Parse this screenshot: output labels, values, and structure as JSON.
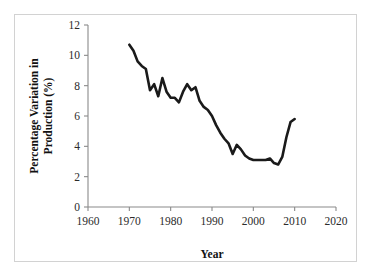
{
  "figure": {
    "background_color": "#ffffff",
    "frame_color": "#d2d2d2",
    "axis_color": "#8a8a8a",
    "line_color": "#1a1a1a"
  },
  "chart_data": {
    "type": "line",
    "title": "",
    "xlabel": "Year",
    "ylabel_line1": "Percentage Variation in",
    "ylabel_line2": "Production (%)",
    "ylabel": "Percentage Variation in Production (%)",
    "xlim": [
      1960,
      2020
    ],
    "ylim": [
      0,
      12
    ],
    "xticks": [
      1960,
      1970,
      1980,
      1990,
      2000,
      2010,
      2020
    ],
    "yticks": [
      0,
      2,
      4,
      6,
      8,
      10,
      12
    ],
    "xtick_labels": [
      "1960",
      "1970",
      "1980",
      "1990",
      "2000",
      "2010",
      "2020"
    ],
    "ytick_labels": [
      "0",
      "2",
      "4",
      "6",
      "8",
      "10",
      "12"
    ],
    "grid": false,
    "legend": false,
    "legend_position": "none",
    "series": [
      {
        "name": "Percentage Variation in Production",
        "color": "#1a1a1a",
        "x": [
          1970,
          1971,
          1972,
          1973,
          1974,
          1975,
          1976,
          1977,
          1978,
          1979,
          1980,
          1981,
          1982,
          1983,
          1984,
          1985,
          1986,
          1987,
          1988,
          1989,
          1990,
          1991,
          1992,
          1993,
          1994,
          1995,
          1996,
          1997,
          1998,
          1999,
          2000,
          2001,
          2002,
          2003,
          2004,
          2005,
          2006,
          2007,
          2008,
          2009,
          2010
        ],
        "values": [
          10.7,
          10.3,
          9.6,
          9.3,
          9.1,
          7.7,
          8.1,
          7.3,
          8.5,
          7.6,
          7.2,
          7.2,
          6.9,
          7.6,
          8.1,
          7.7,
          7.9,
          7.0,
          6.6,
          6.4,
          6.0,
          5.4,
          4.9,
          4.5,
          4.2,
          3.5,
          4.1,
          3.8,
          3.4,
          3.2,
          3.1,
          3.1,
          3.1,
          3.1,
          3.2,
          2.9,
          2.8,
          3.3,
          4.6,
          5.6,
          5.8
        ]
      }
    ]
  }
}
